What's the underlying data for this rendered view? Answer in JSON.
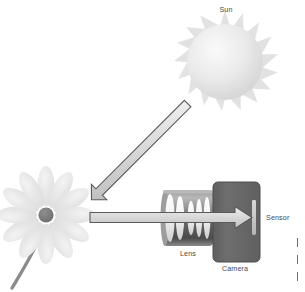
{
  "figure": {
    "title_text": "",
    "background_color": "#ffffff",
    "width": 305,
    "height": 292
  },
  "labels": {
    "sun": "Sun",
    "lens": "Lens",
    "camera": "Camera",
    "sensor": "Sensor"
  },
  "colors": {
    "label_text": "#4a4a4a",
    "sun_body_light": "#f4f4f4",
    "sun_body_dark": "#d6d6d6",
    "sun_ray": "#e2e2e2",
    "flower_petal_light": "#f0f0f0",
    "flower_petal_dark": "#d9d9d9",
    "flower_center": "#7d7d7d",
    "flower_stem": "#8d8d8d",
    "arrow_fill": "#d2d2d2",
    "arrow_stroke": "#5a5a5a",
    "camera_body": "#6b6b6b",
    "camera_body_edge": "#4f4f4f",
    "lens_barrel": "#7a7a7a",
    "lens_barrel_dark": "#2e2e2e",
    "lens_glass": "#fbfbfb",
    "sensor_strip": "#c9c9c9"
  },
  "elements": {
    "sun": {
      "center_x": 225,
      "center_y": 62,
      "disc_radius": 38,
      "ray_count": 18,
      "ray_outer_radius": 52
    },
    "flower": {
      "center_x": 46,
      "center_y": 215,
      "petal_count": 12,
      "petal_length": 38,
      "center_radius": 7.5,
      "stem_description": "curved stem descending to lower left"
    },
    "sun_to_flower_arrow": {
      "from_x": 188,
      "from_y": 104,
      "to_x": 93,
      "to_y": 197,
      "direction": "down-left"
    },
    "flower_to_sensor_arrow": {
      "from_x": 90,
      "from_y": 217,
      "to_x": 253,
      "to_y": 217,
      "direction": "right"
    },
    "lens": {
      "x": 163,
      "y": 190,
      "width": 50,
      "height": 56,
      "glass_element_count": 5
    },
    "camera": {
      "x": 213,
      "y": 182,
      "width": 47,
      "height": 80,
      "corner_radius": 5
    },
    "sensor": {
      "x": 252,
      "y": 200,
      "width": 4,
      "height": 35
    }
  },
  "label_positions": {
    "sun": {
      "x": 226,
      "y": 6
    },
    "lens": {
      "x": 188,
      "y": 250
    },
    "camera": {
      "x": 235,
      "y": 265
    },
    "sensor": {
      "x": 266,
      "y": 214
    }
  },
  "edge_fragments": {
    "description": "partial glyph stems from text cropped at the right page edge",
    "stems": [
      {
        "x": 4,
        "y": 1,
        "h": 9
      },
      {
        "x": 4,
        "y": 18,
        "h": 9
      },
      {
        "x": 4,
        "y": 35,
        "h": 9
      }
    ]
  }
}
